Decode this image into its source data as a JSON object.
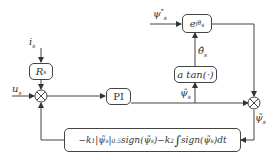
{
  "diagram": {
    "type": "block-diagram",
    "inputs": {
      "i_s": "i",
      "i_s_sub": "s",
      "u_s": "u",
      "u_s_sub": "s",
      "psi_ref": "ψ",
      "psi_ref_sub": "s",
      "psi_ref_sup": "*"
    },
    "blocks": {
      "rs": {
        "label": "R",
        "sub": "s"
      },
      "pi": {
        "label": "PI"
      },
      "atan": {
        "label": "a tan(·)"
      },
      "rot": {
        "label": "e",
        "sup": "jθ̂",
        "sup_sub": "s"
      },
      "feedback": {
        "part1": "−k",
        "part1_sub": "1",
        "part2": "|ψ̃",
        "part2_sub": "s",
        "part3": "|",
        "part3_sup": "0.5",
        "part4": "sign(ψ̃",
        "part4_sub": "s",
        "part5": ")−k",
        "part5_sub": "2",
        "part6": "∫",
        "part7": "sign(ψ̃",
        "part7_sub": "s",
        "part8": ")dt"
      }
    },
    "signals": {
      "psi_hat": "ψ̂",
      "psi_hat_sub": "s",
      "theta_hat": "θ̂",
      "theta_hat_sub": "s",
      "psi_tilde": "ψ̃",
      "psi_tilde_sub": "s"
    },
    "junctions": [
      "left-summing-junction",
      "right-summing-junction"
    ]
  }
}
